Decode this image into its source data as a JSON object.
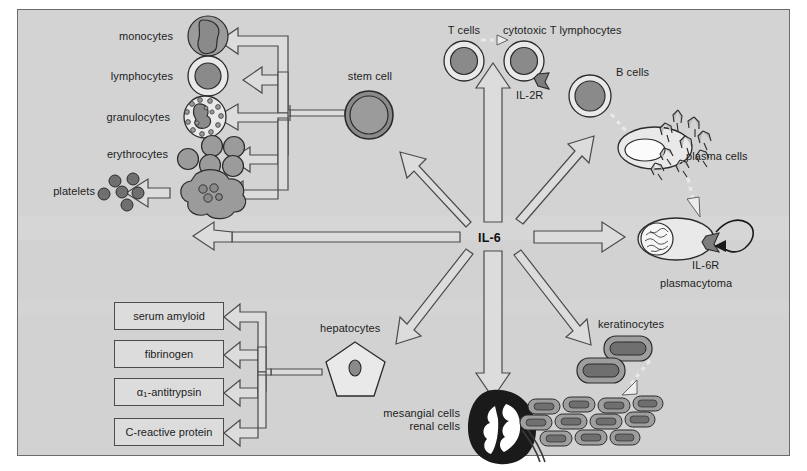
{
  "figure": {
    "hub_label": "IL-6",
    "frame_color": "#6b6b6b",
    "background_color": "#d2d2d2",
    "arrow_fill": "#dcdcdc",
    "arrow_stroke": "#4a4a4a",
    "cell_fill_dark": "#8f8f8f",
    "cell_fill_light": "#f2f2f2",
    "kidney_color": "#1a1a1a"
  },
  "hematopoietic": {
    "stem_cell_label": "stem cell",
    "lineages": [
      {
        "label": "monocytes"
      },
      {
        "label": "lymphocytes"
      },
      {
        "label": "granulocytes"
      },
      {
        "label": "erythrocytes"
      },
      {
        "label": "platelets"
      }
    ]
  },
  "lymphoid": {
    "t_cells_label": "T cells",
    "ctl_label": "cytotoxic T lymphocytes",
    "il2r_label": "IL-2R",
    "b_cells_label": "B cells",
    "plasma_cells_label": "plasma cells",
    "plasmacytoma_label": "plasmacytoma",
    "il6r_label": "IL-6R"
  },
  "hepatic": {
    "hepatocytes_label": "hepatocytes",
    "acute_phase_proteins": [
      {
        "label": "serum amyloid",
        "subscript": ""
      },
      {
        "label": "fibrinogen",
        "subscript": ""
      },
      {
        "label": "α",
        "subscript": "1",
        "label_tail": "-antitrypsin"
      },
      {
        "label": "C-reactive protein",
        "subscript": ""
      }
    ]
  },
  "renal": {
    "line1": "mesangial cells",
    "line2": "renal cells"
  },
  "epidermal": {
    "keratinocytes_label": "keratinocytes"
  }
}
